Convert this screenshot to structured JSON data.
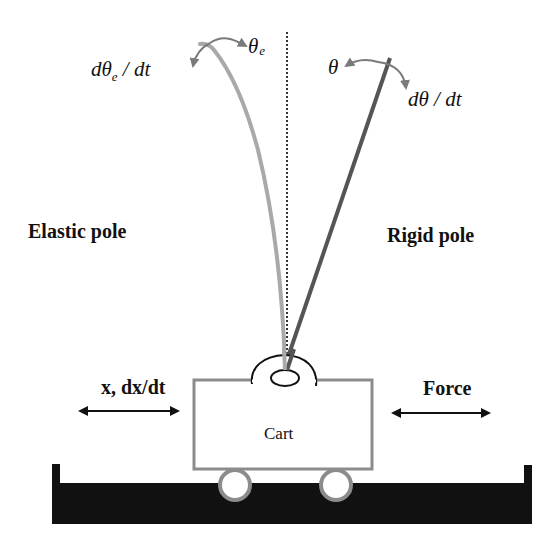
{
  "diagram": {
    "type": "cart-pole schematic",
    "labels": {
      "elastic_pole": "Elastic pole",
      "rigid_pole": "Rigid pole",
      "cart": "Cart",
      "cart_state": "x, dx/dt",
      "force": "Force",
      "theta_e_symbol": "θ",
      "theta_e_subscript": "e",
      "dtheta_e_prefix": "dθ",
      "dtheta_e_subscript": "e",
      "dtheta_e_suffix": " / dt",
      "theta": "θ",
      "dtheta_dt": "dθ / dt"
    },
    "colors": {
      "elastic_pole": "#a9a9a9",
      "rigid_pole": "#555555",
      "angle_arrows": "#7a7a7a",
      "cart_outline": "#8c8c8c",
      "track": "#111111",
      "reference_line": "#333333",
      "text": "#111111"
    }
  }
}
